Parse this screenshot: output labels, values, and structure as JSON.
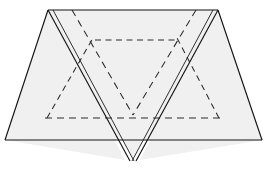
{
  "figure": {
    "canvas": {
      "width": 268,
      "height": 170
    },
    "colors": {
      "background": "#ffffff",
      "paper_fill": "#f0f0f0",
      "edge_stroke": "#141414",
      "crease_stroke": "#2a2a2a"
    },
    "shapes": {
      "background_triangle": {
        "name": "wide-base-triangle",
        "points": "5,140 262,140 218,10 48,10",
        "note": "Large light-gray sheet forming the trapezoid/triangle behind the flap"
      },
      "left_wing": {
        "name": "left-wing",
        "points": "5,140 48,10 125,160"
      },
      "right_wing": {
        "name": "right-wing",
        "points": "262,140 218,10 140,160"
      },
      "inverted_flap": {
        "name": "inverted-triangle-flap",
        "points": "49,11 217,11 133,159",
        "note": "Front-most folded flap pointing downward"
      },
      "flap_inner_layer": {
        "name": "flap-inner-layer",
        "points": "55,11 211,11 133,151"
      }
    },
    "solid_edges": [
      {
        "name": "top-edge",
        "d": "M 48,10 L 218,10"
      },
      {
        "name": "base-edge",
        "d": "M 5,140 L 262,140"
      },
      {
        "name": "left-outer-slope",
        "d": "M 48,10 L 5,140"
      },
      {
        "name": "right-outer-slope",
        "d": "M 218,10 L 262,140"
      },
      {
        "name": "flap-left-edge-outer",
        "d": "M 48,10 L 130,161"
      },
      {
        "name": "flap-left-edge-inner",
        "d": "M 53,10 L 134,161"
      },
      {
        "name": "flap-right-edge-outer",
        "d": "M 218,10 L 136,161"
      },
      {
        "name": "flap-right-edge-inner",
        "d": "M 213,10 L 132,161"
      }
    ],
    "crease_lines": [
      {
        "name": "upper-horizontal-crease",
        "d": "M 95,40 L 176,40"
      },
      {
        "name": "lower-horizontal-crease",
        "d": "M 45,118 L 221,118"
      },
      {
        "name": "inner-v-left-crease",
        "d": "M 72,10 L 133,115"
      },
      {
        "name": "inner-v-right-crease",
        "d": "M 196,10 L 133,115"
      },
      {
        "name": "left-hidden-diagonal",
        "d": "M 47,118 L 93,38"
      },
      {
        "name": "right-hidden-diagonal",
        "d": "M 219,118 L 177,38"
      }
    ],
    "labels": []
  }
}
